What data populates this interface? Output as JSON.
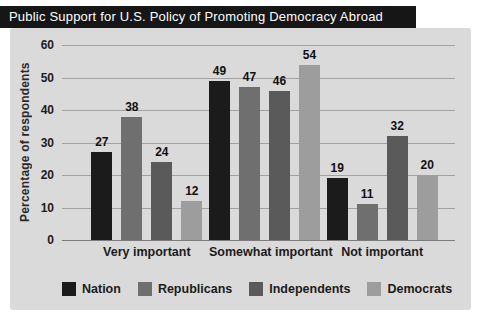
{
  "title_bar": {
    "title": "Public Support for U.S. Policy of Promoting Democracy Abroad"
  },
  "colors": {
    "title_bar_bg": "#161616",
    "title_text": "#ffffff",
    "panel_bg": "#dadada",
    "gridline": "#a2a2a2",
    "axis_baseline": "#7c7c7c",
    "text": "#1c1c1c"
  },
  "chart_data": {
    "type": "bar",
    "title": "Public Support for U.S. Policy of Promoting Democracy Abroad",
    "categories": [
      "Very important",
      "Somewhat important",
      "Not important"
    ],
    "series": [
      {
        "name": "Nation",
        "color": "#1b1b1b",
        "values": [
          27,
          49,
          19
        ]
      },
      {
        "name": "Republicans",
        "color": "#6f6f6f",
        "values": [
          38,
          47,
          11
        ]
      },
      {
        "name": "Independents",
        "color": "#5a5a5a",
        "values": [
          24,
          46,
          32
        ]
      },
      {
        "name": "Democrats",
        "color": "#9d9d9d",
        "values": [
          12,
          54,
          20
        ]
      }
    ],
    "xlabel": "",
    "ylabel": "Percentage of respondents",
    "ylim": [
      0,
      60
    ],
    "yticks": [
      0,
      10,
      20,
      30,
      40,
      50,
      60
    ],
    "grid": true,
    "legend_position": "bottom"
  }
}
